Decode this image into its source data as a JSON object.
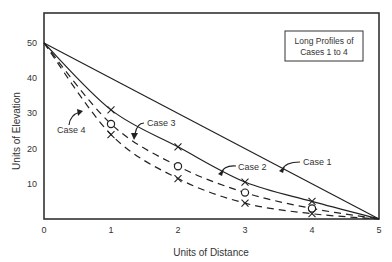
{
  "chart_data": {
    "type": "line",
    "title": "Long Profiles of Cases 1 to 4",
    "title_lines": [
      "Long Profiles of",
      "Cases 1 to 4"
    ],
    "xlabel": "Units of Distance",
    "ylabel": "Units of Elevation",
    "xlim": [
      0,
      5
    ],
    "ylim": [
      0,
      50
    ],
    "x_ticks": [
      0,
      1,
      2,
      3,
      4,
      5
    ],
    "y_ticks": [
      10,
      20,
      30,
      40,
      50
    ],
    "x_tick_labels": [
      "0",
      "1",
      "2",
      "3",
      "4",
      "5"
    ],
    "y_tick_labels": [
      "10",
      "20",
      "30",
      "40",
      "50"
    ],
    "grid": false,
    "legend": "annotations on curves (callout labels)",
    "x": [
      0,
      1,
      2,
      3,
      4,
      5
    ],
    "series": [
      {
        "name": "Case 1",
        "style": "solid",
        "marker": "none",
        "values": [
          50,
          40,
          30,
          20,
          10,
          0
        ]
      },
      {
        "name": "Case 2",
        "style": "solid",
        "marker": "x",
        "values": [
          50,
          31,
          20.5,
          10.5,
          5,
          0
        ]
      },
      {
        "name": "Case 3",
        "style": "dashed",
        "marker": "o",
        "values": [
          50,
          27,
          15,
          7.5,
          3,
          0
        ]
      },
      {
        "name": "Case 4",
        "style": "dashed",
        "marker": "x",
        "values": [
          50,
          24,
          11.5,
          4.5,
          1.5,
          0
        ]
      }
    ],
    "annotations": [
      {
        "text": "Case 1",
        "points_to": "Case 1"
      },
      {
        "text": "Case 2",
        "points_to": "Case 2"
      },
      {
        "text": "Case 3",
        "points_to": "Case 3"
      },
      {
        "text": "Case 4",
        "points_to": "Case 4"
      }
    ]
  },
  "labels": {
    "case1": "Case 1",
    "case2": "Case 2",
    "case3": "Case 3",
    "case4": "Case 4"
  }
}
